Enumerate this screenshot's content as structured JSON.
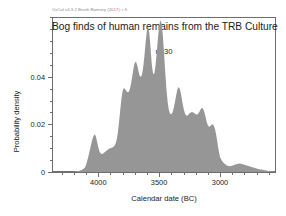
{
  "credit": "OxCal v4.3.2 Bronk Ramsey (2017); r:5",
  "plot": {
    "title": "Bog finds of human remains from the TRB Culture",
    "subtitle": "n=30",
    "fill_color": "#969696",
    "line_color": "#6e6e6e",
    "background": "#ffffff"
  },
  "chart_data": {
    "type": "area",
    "title": "Bog finds of human remains from the TRB Culture",
    "subtitle": "n=30",
    "xlabel": "Calendar date (BC)",
    "ylabel": "Probability density",
    "x_axis": {
      "reversed": true,
      "min": 4380,
      "max": 2540,
      "major_ticks": [
        4000,
        3500,
        3000
      ],
      "major_tick_labels": [
        "4000",
        "3500",
        "3000"
      ],
      "minor_tick_interval": 100
    },
    "y_axis": {
      "min": 0,
      "max": 0.065,
      "major_ticks": [
        0,
        0.02,
        0.04
      ],
      "major_tick_labels": [
        "0",
        "0.02",
        "0.04"
      ],
      "minor_tick_interval": 0.005
    },
    "grid": false,
    "legend": null,
    "series": [
      {
        "name": "Summed probability distribution",
        "fill": "#969696",
        "x": [
          4380,
          4300,
          4220,
          4160,
          4130,
          4110,
          4100,
          4090,
          4080,
          4070,
          4060,
          4050,
          4040,
          4030,
          4020,
          4010,
          4000,
          3990,
          3980,
          3970,
          3960,
          3950,
          3940,
          3930,
          3920,
          3910,
          3900,
          3890,
          3880,
          3870,
          3860,
          3850,
          3840,
          3830,
          3820,
          3810,
          3800,
          3790,
          3780,
          3770,
          3760,
          3750,
          3740,
          3730,
          3720,
          3710,
          3700,
          3690,
          3680,
          3670,
          3660,
          3650,
          3640,
          3630,
          3620,
          3610,
          3600,
          3590,
          3580,
          3570,
          3560,
          3550,
          3540,
          3530,
          3520,
          3510,
          3500,
          3490,
          3480,
          3470,
          3460,
          3450,
          3440,
          3430,
          3420,
          3410,
          3400,
          3390,
          3380,
          3370,
          3360,
          3350,
          3340,
          3330,
          3320,
          3310,
          3300,
          3290,
          3280,
          3270,
          3260,
          3250,
          3240,
          3230,
          3220,
          3210,
          3200,
          3190,
          3180,
          3170,
          3160,
          3150,
          3140,
          3130,
          3120,
          3110,
          3100,
          3090,
          3080,
          3070,
          3060,
          3050,
          3040,
          3030,
          3020,
          3010,
          3000,
          2980,
          2960,
          2940,
          2920,
          2900,
          2880,
          2860,
          2840,
          2820,
          2800,
          2760,
          2720,
          2680,
          2640,
          2600,
          2560,
          2540
        ],
        "y": [
          0.0,
          0.0,
          0.0,
          0.0004,
          0.001,
          0.0018,
          0.003,
          0.0048,
          0.0068,
          0.009,
          0.0112,
          0.0134,
          0.015,
          0.0158,
          0.015,
          0.0128,
          0.0104,
          0.0086,
          0.0078,
          0.0076,
          0.0078,
          0.0082,
          0.0086,
          0.009,
          0.0094,
          0.0098,
          0.01,
          0.0102,
          0.0104,
          0.0108,
          0.0116,
          0.0132,
          0.0162,
          0.0206,
          0.0258,
          0.0306,
          0.034,
          0.0352,
          0.0348,
          0.034,
          0.0334,
          0.0336,
          0.0348,
          0.0372,
          0.0404,
          0.0436,
          0.0458,
          0.0462,
          0.0448,
          0.0424,
          0.0404,
          0.0398,
          0.041,
          0.0442,
          0.0492,
          0.0548,
          0.0594,
          0.061,
          0.058,
          0.0516,
          0.045,
          0.0412,
          0.0412,
          0.0444,
          0.0498,
          0.056,
          0.0612,
          0.0636,
          0.0624,
          0.0576,
          0.05,
          0.042,
          0.0348,
          0.0294,
          0.026,
          0.0244,
          0.0242,
          0.025,
          0.0268,
          0.0294,
          0.0322,
          0.0346,
          0.0356,
          0.0348,
          0.0326,
          0.0296,
          0.0268,
          0.0248,
          0.0238,
          0.0236,
          0.024,
          0.0246,
          0.025,
          0.0252,
          0.025,
          0.0246,
          0.0242,
          0.024,
          0.0244,
          0.0252,
          0.0262,
          0.0268,
          0.0266,
          0.0254,
          0.0234,
          0.0212,
          0.0196,
          0.019,
          0.0192,
          0.0198,
          0.02,
          0.0194,
          0.0178,
          0.0152,
          0.012,
          0.0088,
          0.0062,
          0.0044,
          0.0034,
          0.0026,
          0.0024,
          0.0026,
          0.003,
          0.0034,
          0.0036,
          0.0034,
          0.003,
          0.0024,
          0.0018,
          0.0012,
          0.0008,
          0.0004,
          0.0002,
          0.0
        ]
      }
    ]
  },
  "axis_ticks": {
    "x_major": [
      {
        "value": 4000,
        "label": "4000"
      },
      {
        "value": 3500,
        "label": "3500"
      },
      {
        "value": 3000,
        "label": "3000"
      }
    ],
    "y_major": [
      {
        "value": 0,
        "label": "0"
      },
      {
        "value": 0.02,
        "label": "0.02"
      },
      {
        "value": 0.04,
        "label": "0.04"
      }
    ]
  }
}
